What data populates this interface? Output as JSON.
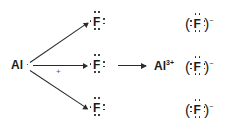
{
  "diagram": {
    "type": "lewis-dot-reaction",
    "equation": "Al + 3 F -> Al(3+) + 3 F(-)",
    "ink_color": "#1a1a1a",
    "background_color": "#ffffff"
  },
  "reactants": {
    "metal": {
      "symbol": "Al",
      "name": "aluminum-atom",
      "valence_electrons": 3,
      "dots_shown": 1,
      "dot_positions": [
        "right"
      ]
    },
    "nonmetals": [
      {
        "symbol": "F",
        "name": "fluorine-atom-top",
        "valence_electrons": 7,
        "dot_positions": [
          "top-left",
          "top-right",
          "bottom-left",
          "bottom-right",
          "right-upper",
          "right-lower",
          "left-single"
        ]
      },
      {
        "symbol": "F",
        "name": "fluorine-atom-middle",
        "valence_electrons": 7,
        "dot_positions": [
          "top-left",
          "top-right",
          "bottom-left",
          "bottom-right",
          "right-upper",
          "right-lower",
          "left-single"
        ]
      },
      {
        "symbol": "F",
        "name": "fluorine-atom-bottom",
        "valence_electrons": 7,
        "dot_positions": [
          "top-left",
          "top-right",
          "bottom-left",
          "bottom-right",
          "right-upper",
          "right-lower",
          "left-single"
        ]
      }
    ],
    "plus_sign": "+"
  },
  "products": {
    "cation": {
      "symbol": "Al",
      "charge": "3+",
      "name": "aluminum-ion",
      "valence_electrons": 0
    },
    "anions": [
      {
        "symbol": "F",
        "charge": "−",
        "name": "fluoride-ion-top",
        "valence_electrons": 8,
        "bracket_left": "(",
        "bracket_right": ")"
      },
      {
        "symbol": "F",
        "charge": "−",
        "name": "fluoride-ion-middle",
        "valence_electrons": 8,
        "bracket_left": "(",
        "bracket_right": ")"
      },
      {
        "symbol": "F",
        "charge": "−",
        "name": "fluoride-ion-bottom",
        "valence_electrons": 8,
        "bracket_left": "(",
        "bracket_right": ")"
      }
    ]
  },
  "arrows": {
    "electron_transfer_count": 3,
    "reaction_arrow_label": ""
  }
}
